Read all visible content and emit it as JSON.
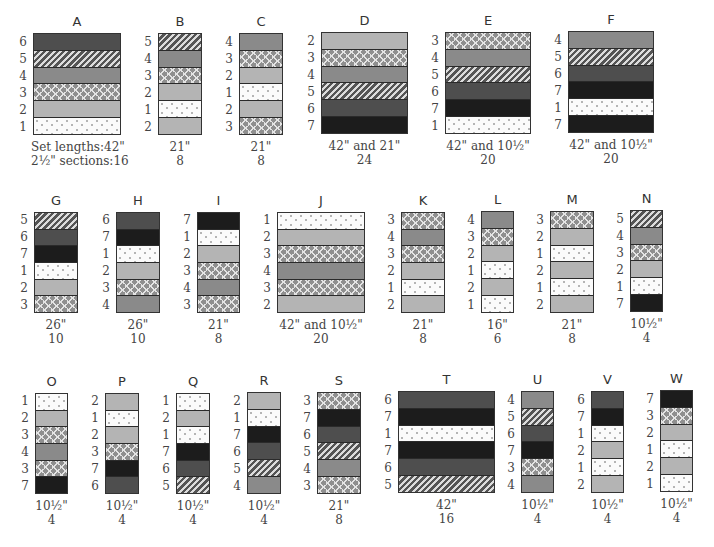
{
  "legend": {
    "fabric_numbers": {
      "1": {
        "name": "white-dotted",
        "color": "#fbfbfb"
      },
      "2": {
        "name": "light-gray",
        "color": "#b4b4b4"
      },
      "3": {
        "name": "gray-chevron",
        "color": "#8f8f8f"
      },
      "4": {
        "name": "medium-gray",
        "color": "#8a8a8a"
      },
      "5": {
        "name": "diagonal-hatch",
        "color": "#545454"
      },
      "6": {
        "name": "dark-gray",
        "color": "#4e4e4e"
      },
      "7": {
        "name": "black",
        "color": "#1c1c1c"
      }
    }
  },
  "sets": [
    {
      "id": "A",
      "label": "A",
      "stripes": [
        6,
        5,
        4,
        3,
        2,
        1
      ],
      "length_label": "Set lengths:",
      "length": "42\"",
      "sections_label": "2½\" sections:",
      "sections": "16",
      "box": [
        33,
        33,
        88,
        102
      ]
    },
    {
      "id": "B",
      "label": "B",
      "stripes": [
        5,
        4,
        3,
        2,
        1,
        2
      ],
      "length": "21\"",
      "sections": "8",
      "box": [
        158,
        33,
        44,
        102
      ]
    },
    {
      "id": "C",
      "label": "C",
      "stripes": [
        4,
        3,
        2,
        1,
        2,
        3
      ],
      "length": "21\"",
      "sections": "8",
      "box": [
        239,
        33,
        44,
        102
      ]
    },
    {
      "id": "D",
      "label": "D",
      "stripes": [
        2,
        3,
        4,
        5,
        6,
        7
      ],
      "length": "42\" and 21\"",
      "sections": "24",
      "box": [
        321,
        32,
        87,
        102
      ]
    },
    {
      "id": "E",
      "label": "E",
      "stripes": [
        3,
        4,
        5,
        6,
        7,
        1
      ],
      "length": "42\" and 10½\"",
      "sections": "20",
      "box": [
        445,
        32,
        86,
        102
      ]
    },
    {
      "id": "F",
      "label": "F",
      "stripes": [
        4,
        5,
        6,
        7,
        1,
        7
      ],
      "length": "42\" and 10½\"",
      "sections": "20",
      "box": [
        568,
        31,
        86,
        102
      ]
    },
    {
      "id": "G",
      "label": "G",
      "stripes": [
        5,
        6,
        7,
        1,
        2,
        3
      ],
      "length": "26\"",
      "sections": "10",
      "box": [
        34,
        212,
        44,
        101
      ]
    },
    {
      "id": "H",
      "label": "H",
      "stripes": [
        6,
        7,
        1,
        2,
        3,
        4
      ],
      "length": "26\"",
      "sections": "10",
      "box": [
        116,
        212,
        44,
        101
      ]
    },
    {
      "id": "I",
      "label": "I",
      "stripes": [
        7,
        1,
        2,
        3,
        4,
        3
      ],
      "length": "21\"",
      "sections": "8",
      "box": [
        197,
        212,
        43,
        101
      ]
    },
    {
      "id": "J",
      "label": "J",
      "stripes": [
        1,
        2,
        3,
        4,
        3,
        2
      ],
      "length": "42\" and 10½\"",
      "sections": "20",
      "box": [
        277,
        212,
        88,
        101
      ]
    },
    {
      "id": "K",
      "label": "K",
      "stripes": [
        3,
        4,
        3,
        2,
        1,
        2
      ],
      "length": "21\"",
      "sections": "8",
      "box": [
        401,
        212,
        44,
        101
      ]
    },
    {
      "id": "L",
      "label": "L",
      "stripes": [
        4,
        3,
        2,
        1,
        2,
        1
      ],
      "length": "16\"",
      "sections": "6",
      "box": [
        481,
        211,
        33,
        102
      ]
    },
    {
      "id": "M",
      "label": "M",
      "stripes": [
        3,
        2,
        1,
        2,
        1,
        2
      ],
      "length": "21\"",
      "sections": "8",
      "box": [
        550,
        211,
        44,
        102
      ]
    },
    {
      "id": "N",
      "label": "N",
      "stripes": [
        5,
        4,
        3,
        2,
        1,
        7
      ],
      "length": "10½\"",
      "sections": "4",
      "box": [
        630,
        210,
        33,
        102
      ]
    },
    {
      "id": "O",
      "label": "O",
      "stripes": [
        1,
        2,
        3,
        4,
        3,
        7
      ],
      "length": "10½\"",
      "sections": "4",
      "box": [
        35,
        393,
        33,
        101
      ]
    },
    {
      "id": "P",
      "label": "P",
      "stripes": [
        2,
        1,
        2,
        3,
        7,
        6
      ],
      "length": "10½\"",
      "sections": "4",
      "box": [
        105,
        393,
        34,
        101
      ]
    },
    {
      "id": "Q",
      "label": "Q",
      "stripes": [
        1,
        2,
        1,
        7,
        6,
        5
      ],
      "length": "10½\"",
      "sections": "4",
      "box": [
        176,
        393,
        34,
        101
      ]
    },
    {
      "id": "R",
      "label": "R",
      "stripes": [
        2,
        1,
        7,
        6,
        5,
        4
      ],
      "length": "10½\"",
      "sections": "4",
      "box": [
        247,
        392,
        34,
        102
      ]
    },
    {
      "id": "S",
      "label": "S",
      "stripes": [
        3,
        7,
        6,
        5,
        4,
        3
      ],
      "length": "21\"",
      "sections": "8",
      "box": [
        317,
        392,
        44,
        102
      ]
    },
    {
      "id": "T",
      "label": "T",
      "stripes": [
        6,
        7,
        1,
        7,
        6,
        5
      ],
      "length": "42\"",
      "sections": "16",
      "box": [
        398,
        391,
        97,
        102
      ]
    },
    {
      "id": "U",
      "label": "U",
      "stripes": [
        4,
        5,
        6,
        7,
        3,
        4
      ],
      "length": "10½\"",
      "sections": "4",
      "box": [
        521,
        391,
        33,
        102
      ]
    },
    {
      "id": "V",
      "label": "V",
      "stripes": [
        6,
        7,
        1,
        2,
        1,
        2
      ],
      "length": "10½\"",
      "sections": "4",
      "box": [
        591,
        391,
        33,
        102
      ]
    },
    {
      "id": "W",
      "label": "W",
      "stripes": [
        7,
        3,
        2,
        1,
        2,
        1
      ],
      "length": "10½\"",
      "sections": "4",
      "box": [
        660,
        390,
        33,
        102
      ]
    }
  ]
}
